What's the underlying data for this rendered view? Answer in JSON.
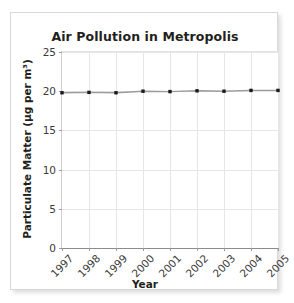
{
  "chart_data": {
    "type": "line",
    "title": "Air Pollution in Metropolis",
    "xlabel": "Year",
    "ylabel": "Particulate Matter (µg per m³)",
    "categories": [
      "1997",
      "1998",
      "1999",
      "2000",
      "2001",
      "2002",
      "2003",
      "2004",
      "2005"
    ],
    "x": [
      1997,
      1998,
      1999,
      2000,
      2001,
      2002,
      2003,
      2004,
      2005
    ],
    "series": [
      {
        "name": "Particulate Matter",
        "values": [
          19.8,
          19.85,
          19.8,
          20.0,
          19.95,
          20.05,
          20.0,
          20.1,
          20.1
        ]
      }
    ],
    "ylim": [
      0,
      25
    ],
    "yticks": [
      0,
      5,
      10,
      15,
      20,
      25
    ],
    "ytick_labels": [
      "0",
      "5",
      "10",
      "15",
      "20",
      "25"
    ],
    "xtick_labels": [
      "1997",
      "1998",
      "1999",
      "2000",
      "2001",
      "2002",
      "2003",
      "2004",
      "2005"
    ],
    "xtick_rotation": -45,
    "grid": true,
    "legend": false,
    "marker": "square",
    "line_color": "#9b9b9b",
    "marker_color": "#1a1a1a",
    "grid_color": "#e6e6e6",
    "text_color": "#231f20",
    "background_color": "#ffffff"
  },
  "card": {
    "border_color": "#d8d8d8"
  }
}
